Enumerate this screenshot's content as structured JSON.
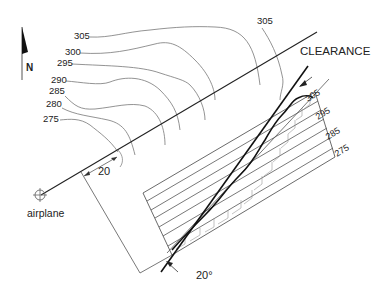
{
  "diagram": {
    "north_label": "N",
    "clearance_label": "CLEARANCE",
    "airplane_label": "airplane",
    "distance_label": "20",
    "angle_label": "20°",
    "map_contours": [
      {
        "label": "305",
        "x": 74,
        "y": 39
      },
      {
        "label": "300",
        "x": 65,
        "y": 55
      },
      {
        "label": "295",
        "x": 57,
        "y": 66
      },
      {
        "label": "290",
        "x": 51,
        "y": 83
      },
      {
        "label": "285",
        "x": 49,
        "y": 94
      },
      {
        "label": "280",
        "x": 46,
        "y": 107
      },
      {
        "label": "275",
        "x": 43,
        "y": 122
      }
    ],
    "map_contour_top_label": {
      "label": "305",
      "x": 262,
      "y": 24
    },
    "profile_labels": [
      {
        "label": "305",
        "x": 308,
        "y": 102
      },
      {
        "label": "295",
        "x": 318,
        "y": 120
      },
      {
        "label": "285",
        "x": 328,
        "y": 140
      },
      {
        "label": "275",
        "x": 337,
        "y": 157
      }
    ],
    "colors": {
      "line": "#111111",
      "contour": "#777777",
      "hatch": "#999999",
      "background": "#ffffff"
    }
  }
}
